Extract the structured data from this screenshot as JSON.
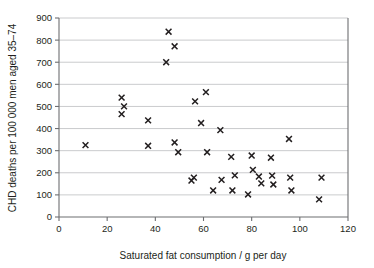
{
  "chart_data": {
    "type": "scatter",
    "title": "",
    "xlabel": "Saturated fat consumption / g per day",
    "ylabel": "CHD deaths per 100 000 men aged 35–74",
    "xlim": [
      0,
      120
    ],
    "ylim": [
      0,
      900
    ],
    "xticks": [
      0,
      20,
      40,
      60,
      80,
      100,
      120
    ],
    "yticks": [
      0,
      100,
      200,
      300,
      400,
      500,
      600,
      700,
      800,
      900
    ],
    "xtick_labels": [
      "0",
      "20",
      "40",
      "60",
      "80",
      "100",
      "120"
    ],
    "ytick_labels": [
      "0",
      "100",
      "200",
      "300",
      "400",
      "500",
      "600",
      "700",
      "800",
      "900"
    ],
    "grid": "horizontal",
    "legend": "none",
    "marker": "x",
    "marker_color": "#231f20",
    "series": [
      {
        "name": "countries",
        "points": [
          [
            11,
            325
          ],
          [
            26,
            540
          ],
          [
            26,
            465
          ],
          [
            27,
            500
          ],
          [
            37,
            437
          ],
          [
            37,
            322
          ],
          [
            44.5,
            700
          ],
          [
            45.5,
            838
          ],
          [
            48,
            772
          ],
          [
            48,
            337
          ],
          [
            49.5,
            293
          ],
          [
            55,
            165
          ],
          [
            56,
            178
          ],
          [
            56.5,
            523
          ],
          [
            59,
            425
          ],
          [
            61,
            565
          ],
          [
            61.5,
            293
          ],
          [
            64,
            120
          ],
          [
            67,
            393
          ],
          [
            67.5,
            168
          ],
          [
            71.5,
            272
          ],
          [
            72,
            120
          ],
          [
            73,
            188
          ],
          [
            78.5,
            102
          ],
          [
            80,
            278
          ],
          [
            80.5,
            213
          ],
          [
            83,
            183
          ],
          [
            84,
            152
          ],
          [
            88,
            268
          ],
          [
            88.5,
            187
          ],
          [
            89,
            147
          ],
          [
            95.5,
            353
          ],
          [
            96,
            178
          ],
          [
            96.5,
            120
          ],
          [
            108,
            80
          ],
          [
            109,
            178
          ]
        ]
      }
    ]
  },
  "axes": {
    "y_title": "CHD deaths per 100 000 men aged 35–74",
    "x_title": "Saturated fat consumption / g per day"
  }
}
